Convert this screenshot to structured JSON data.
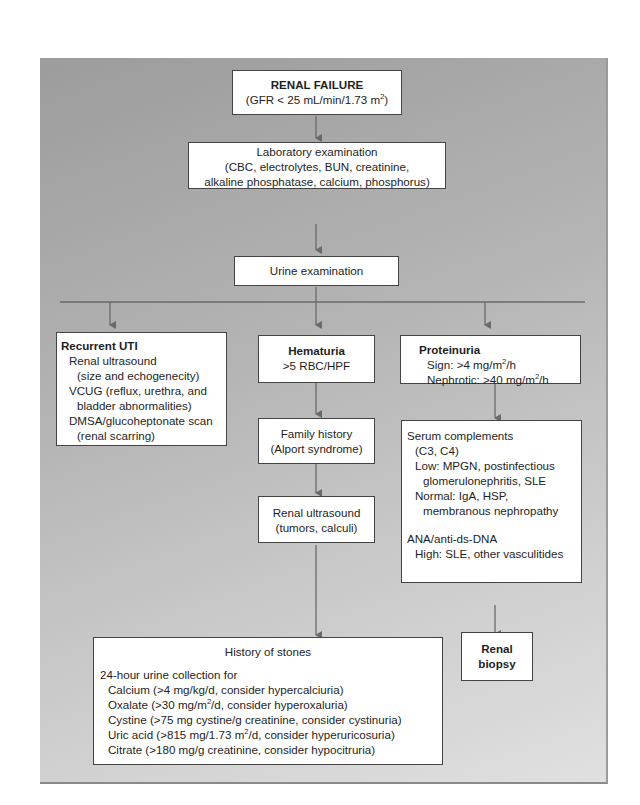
{
  "title_box": {
    "title": "RENAL FAILURE",
    "subtitle_prefix": "(GFR < 25 mL/min/1.73 m",
    "subtitle_sup": "2",
    "subtitle_suffix": ")"
  },
  "lab_exam": {
    "line1": "Laboratory examination",
    "line2": "(CBC, electrolytes, BUN, creatinine,",
    "line3": "alkaline phosphatase, calcium, phosphorus)"
  },
  "urine_exam": {
    "label": "Urine examination"
  },
  "recurrent_uti": {
    "title": "Recurrent UTI",
    "lines": [
      {
        "text": "Renal ultrasound",
        "indent": 1
      },
      {
        "text": "(size and echogenecity)",
        "indent": 2
      },
      {
        "text": "VCUG (reflux, urethra, and",
        "indent": 1
      },
      {
        "text": "bladder abnormalities)",
        "indent": 2
      },
      {
        "text": "DMSA/glucoheptonate scan",
        "indent": 1
      },
      {
        "text": "(renal scarring)",
        "indent": 2
      }
    ]
  },
  "hematuria": {
    "title": "Hematuria",
    "subtitle": ">5 RBC/HPF"
  },
  "family_history": {
    "line1": "Family history",
    "line2": "(Alport syndrome)"
  },
  "renal_ultrasound": {
    "line1": "Renal ultrasound",
    "line2": "(tumors, calculi)"
  },
  "proteinuria": {
    "title": "Proteinuria",
    "sign_prefix": "Sign: >4 mg/m",
    "sign_sup": "2",
    "sign_suffix": "/h",
    "nephrotic_prefix": "Nephrotic: >40 mg/m",
    "nephrotic_sup": "2",
    "nephrotic_suffix": "/h"
  },
  "serum_complements": {
    "lines": [
      {
        "text": "Serum complements",
        "indent": 0
      },
      {
        "text": "(C3, C4)",
        "indent": 1
      },
      {
        "text": "Low: MPGN, postinfectious",
        "indent": 1
      },
      {
        "text": "glomerulonephritis, SLE",
        "indent": 2
      },
      {
        "text": "Normal: IgA, HSP,",
        "indent": 1
      },
      {
        "text": "membranous nephropathy",
        "indent": 2
      }
    ],
    "ana_title": "ANA/anti-ds-DNA",
    "ana_line": "High: SLE, other vasculitides"
  },
  "renal_biopsy": {
    "line1": "Renal",
    "line2": "biopsy"
  },
  "history_of_stones": {
    "title": "History of stones",
    "intro": "24-hour urine collection for",
    "items": [
      {
        "prefix": "Calcium (>4 mg/kg/d, consider hypercalciuria)",
        "sup": "",
        "suffix": ""
      },
      {
        "prefix": "Oxalate (>30 mg/m",
        "sup": "2",
        "suffix": "/d, consider hyperoxaluria)"
      },
      {
        "prefix": "Cystine (>75 mg cystine/g creatinine, consider cystinuria)",
        "sup": "",
        "suffix": ""
      },
      {
        "prefix": "Uric acid (>815 mg/1.73 m",
        "sup": "2",
        "suffix": "/d, consider hyperuricosuria)"
      },
      {
        "prefix": "Citrate (>180 mg/g creatinine, consider hypocitruria)",
        "sup": "",
        "suffix": ""
      }
    ]
  },
  "colors": {
    "arrow": "#6a6a6a",
    "box_border": "#444444",
    "background_dark": "#9c9c9c",
    "background_light": "#e0e0e0"
  }
}
